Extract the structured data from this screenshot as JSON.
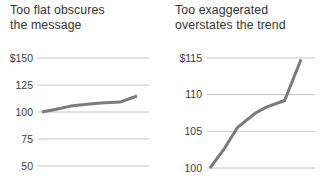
{
  "page": {
    "background": "#ffffff"
  },
  "colors": {
    "title_text": "#343434",
    "tick_text": "#3d3d3d",
    "gridline": "#c4c4c4",
    "data_line": "#7b7b7b"
  },
  "chart_data": [
    {
      "type": "line",
      "title": "Too flat obscures the message",
      "title_lines": [
        "Too flat obscures",
        "the message"
      ],
      "ylabel": "",
      "xlabel": "",
      "ylim": [
        50,
        150
      ],
      "yticks": [
        {
          "label": "$150",
          "value": 150
        },
        {
          "label": "125",
          "value": 125
        },
        {
          "label": "100",
          "value": 100
        },
        {
          "label": "75",
          "value": 75
        },
        {
          "label": "50",
          "value": 50
        }
      ],
      "grid": true,
      "legend": "none",
      "series": [
        {
          "name": "index-value",
          "x_fraction": [
            0,
            0.15,
            0.3,
            0.5,
            0.62,
            0.82,
            1.0
          ],
          "values": [
            100,
            102.5,
            105.5,
            107.5,
            108.3,
            109.2,
            114.8
          ]
        }
      ]
    },
    {
      "type": "line",
      "title": "Too exaggerated overstates the trend",
      "title_lines": [
        "Too exaggerated",
        "overstates the trend"
      ],
      "ylabel": "",
      "xlabel": "",
      "ylim": [
        100,
        115
      ],
      "yticks": [
        {
          "label": "$115",
          "value": 115
        },
        {
          "label": "110",
          "value": 110
        },
        {
          "label": "105",
          "value": 105
        },
        {
          "label": "100",
          "value": 100
        }
      ],
      "grid": true,
      "legend": "none",
      "series": [
        {
          "name": "index-value",
          "x_fraction": [
            0,
            0.15,
            0.3,
            0.5,
            0.62,
            0.82,
            1.0
          ],
          "values": [
            100,
            102.5,
            105.5,
            107.5,
            108.3,
            109.2,
            114.8
          ]
        }
      ]
    }
  ]
}
